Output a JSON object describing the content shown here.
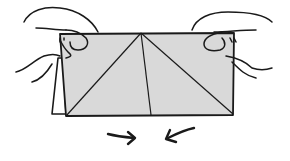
{
  "illustration": {
    "title": "Origami folding step",
    "description": "Two hands hold the top corners of a folded paper square and push the sides together, with arrows indicating inward motion",
    "colors": {
      "paper_fill": "#d9d9d9",
      "line": "#1a1a1a",
      "background": "#ffffff"
    },
    "arrows": [
      {
        "name": "left-arrow",
        "direction": "right"
      },
      {
        "name": "right-arrow",
        "direction": "left"
      }
    ]
  }
}
